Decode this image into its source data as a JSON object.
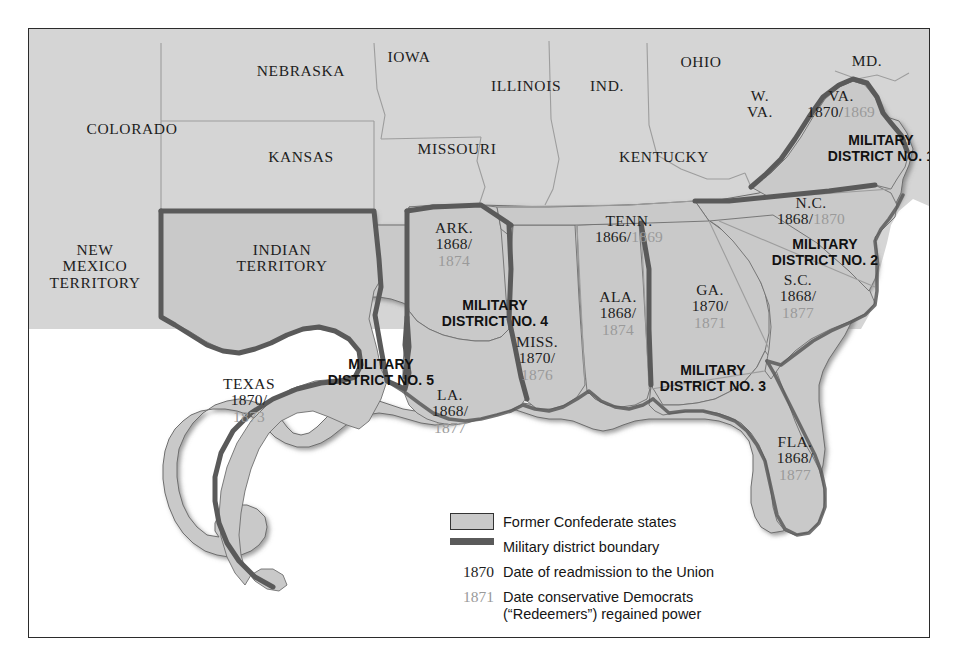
{
  "map": {
    "title": "Reconstruction Military Districts",
    "colors": {
      "confederate_fill": "#c9c9c9",
      "union_fill": "#d6d6d6",
      "district_boundary": "#5a5a5a",
      "state_line": "#9d9d9d",
      "readmission_year": "#1d1d1d",
      "redeemer_year": "#9a9a9a",
      "frame": "#2b2b2b",
      "water": "#ffffff"
    },
    "union_labels": [
      {
        "name": "COLORADO",
        "x": 103,
        "y": 108,
        "lines": [
          "COLORADO"
        ]
      },
      {
        "name": "NEBRASKA",
        "x": 272,
        "y": 50,
        "lines": [
          "NEBRASKA"
        ]
      },
      {
        "name": "IOWA",
        "x": 405,
        "y": 38,
        "lines": [
          "IOWA"
        ]
      },
      {
        "name": "KANSAS",
        "x": 272,
        "y": 140,
        "lines": [
          "KANSAS"
        ]
      },
      {
        "name": "MISSOURI",
        "x": 455,
        "y": 138,
        "lines": [
          "MISSOURI"
        ]
      },
      {
        "name": "ILLINOIS",
        "x": 525,
        "y": 74,
        "lines": [
          "ILLINOIS"
        ]
      },
      {
        "name": "IND.",
        "x": 607,
        "y": 74,
        "lines": [
          "IND."
        ]
      },
      {
        "name": "OHIO",
        "x": 700,
        "y": 48,
        "lines": [
          "OHIO"
        ]
      },
      {
        "name": "KENTUCKY",
        "x": 660,
        "y": 158,
        "lines": [
          "KENTUCKY"
        ]
      },
      {
        "name": "W. VA.",
        "x": 757,
        "y": 84,
        "lines": [
          "W.",
          "VA."
        ]
      },
      {
        "name": "MD.",
        "x": 864,
        "y": 48,
        "lines": [
          "MD."
        ]
      },
      {
        "name": "NEW MEXICO TERRITORY",
        "x": 92,
        "y": 232,
        "lines": [
          "NEW",
          "MEXICO",
          "TERRITORY"
        ]
      },
      {
        "name": "INDIAN TERRITORY",
        "x": 290,
        "y": 232,
        "lines": [
          "INDIAN",
          "TERRITORY"
        ]
      }
    ],
    "confederate_states": [
      {
        "abbr": "VA.",
        "x": 838,
        "y": 78,
        "readmitted": "1870",
        "redeemed": "1869",
        "inline": true
      },
      {
        "abbr": "N.C.",
        "x": 808,
        "y": 186,
        "readmitted": "1868",
        "redeemed": "1870",
        "inline": true
      },
      {
        "abbr": "TENN.",
        "x": 626,
        "y": 210,
        "readmitted": "1866",
        "redeemed": "1869",
        "inline": true
      },
      {
        "abbr": "S.C.",
        "x": 795,
        "y": 268,
        "readmitted": "1868",
        "redeemed": "1877",
        "inline": false
      },
      {
        "abbr": "GA.",
        "x": 707,
        "y": 278,
        "readmitted": "1870",
        "redeemed": "1871",
        "inline": false
      },
      {
        "abbr": "ALA.",
        "x": 616,
        "y": 284,
        "readmitted": "1868",
        "redeemed": "1874",
        "inline": false
      },
      {
        "abbr": "MISS.",
        "x": 533,
        "y": 330,
        "readmitted": "1870",
        "redeemed": "1876",
        "inline": false
      },
      {
        "abbr": "ARK.",
        "x": 452,
        "y": 216,
        "readmitted": "1868",
        "redeemed": "1874",
        "inline": false
      },
      {
        "abbr": "LA.",
        "x": 447,
        "y": 383,
        "readmitted": "1868",
        "redeemed": "1877",
        "inline": false
      },
      {
        "abbr": "TEXAS",
        "x": 245,
        "y": 372,
        "readmitted": "1870",
        "redeemed": "1873",
        "inline": false
      },
      {
        "abbr": "FLA.",
        "x": 792,
        "y": 430,
        "readmitted": "1868",
        "redeemed": "1877",
        "inline": false
      }
    ],
    "districts": [
      {
        "number": "1",
        "line1": "MILITARY",
        "line2": "DISTRICT NO. 1",
        "x": 876,
        "y": 120
      },
      {
        "number": "2",
        "line1": "MILITARY",
        "line2": "DISTRICT NO. 2",
        "x": 822,
        "y": 224
      },
      {
        "number": "3",
        "line1": "MILITARY",
        "line2": "DISTRICT NO. 3",
        "x": 710,
        "y": 350
      },
      {
        "number": "4",
        "line1": "MILITARY",
        "line2": "DISTRICT NO. 4",
        "x": 492,
        "y": 285
      },
      {
        "number": "5",
        "line1": "MILITARY",
        "line2": "DISTRICT NO. 5",
        "x": 378,
        "y": 344
      }
    ],
    "legend": {
      "rows": [
        {
          "key_type": "swatch",
          "key_text": "",
          "text": "Former Confederate states"
        },
        {
          "key_type": "line",
          "key_text": "",
          "text": "Military district boundary"
        },
        {
          "key_type": "year",
          "key_text": "1870",
          "key_color": "dark",
          "text": "Date of readmission to the Union"
        },
        {
          "key_type": "year",
          "key_text": "1871",
          "key_color": "light",
          "text": "Date conservative Democrats\n(“Redeemers”) regained power"
        }
      ]
    }
  }
}
